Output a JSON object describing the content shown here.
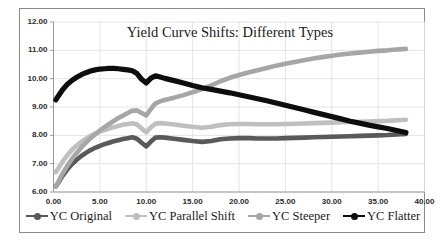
{
  "chart_data": {
    "type": "line",
    "title": "Yield Curve Shifts: Different Types",
    "xlabel": "",
    "ylabel": "",
    "xlim": [
      0,
      40
    ],
    "ylim": [
      6,
      12
    ],
    "xticks": [
      "0.00",
      "5.00",
      "10.00",
      "15.00",
      "20.00",
      "25.00",
      "30.00",
      "35.00",
      "40.00"
    ],
    "yticks": [
      "6.00",
      "7.00",
      "8.00",
      "9.00",
      "10.00",
      "11.00",
      "12.00"
    ],
    "grid": true,
    "legend_position": "bottom",
    "x": [
      0.25,
      0.5,
      1,
      1.5,
      2,
      2.5,
      3,
      3.5,
      4,
      4.5,
      5,
      5.5,
      6,
      6.5,
      7,
      7.5,
      8,
      8.5,
      9,
      9.5,
      10,
      10.5,
      11,
      11.5,
      12,
      13,
      14,
      15,
      16,
      17,
      18,
      19,
      20,
      21,
      22,
      23,
      24,
      25,
      26,
      27,
      28,
      29,
      30,
      31,
      32,
      33,
      34,
      35,
      36,
      37,
      38
    ],
    "series": [
      {
        "name": "YC Original",
        "color": "#595959",
        "values": [
          6.2,
          6.32,
          6.58,
          6.8,
          6.99,
          7.14,
          7.27,
          7.38,
          7.48,
          7.56,
          7.63,
          7.69,
          7.74,
          7.79,
          7.83,
          7.87,
          7.9,
          7.93,
          7.88,
          7.74,
          7.61,
          7.78,
          7.92,
          7.93,
          7.92,
          7.88,
          7.84,
          7.8,
          7.77,
          7.8,
          7.86,
          7.89,
          7.9,
          7.9,
          7.89,
          7.89,
          7.89,
          7.9,
          7.91,
          7.92,
          7.93,
          7.94,
          7.95,
          7.96,
          7.97,
          7.98,
          7.99,
          8.0,
          8.01,
          8.03,
          8.05
        ]
      },
      {
        "name": "YC Parallel Shift",
        "color": "#bfbfbf",
        "values": [
          6.7,
          6.82,
          7.08,
          7.3,
          7.49,
          7.64,
          7.77,
          7.88,
          7.98,
          8.06,
          8.13,
          8.19,
          8.24,
          8.29,
          8.33,
          8.37,
          8.4,
          8.43,
          8.38,
          8.24,
          8.11,
          8.28,
          8.42,
          8.43,
          8.42,
          8.38,
          8.34,
          8.3,
          8.27,
          8.3,
          8.36,
          8.39,
          8.4,
          8.4,
          8.39,
          8.39,
          8.39,
          8.4,
          8.41,
          8.42,
          8.43,
          8.44,
          8.45,
          8.46,
          8.47,
          8.48,
          8.49,
          8.5,
          8.51,
          8.53,
          8.55
        ]
      },
      {
        "name": "YC Steeper",
        "color": "#a6a6a6",
        "values": [
          6.2,
          6.35,
          6.66,
          6.93,
          7.17,
          7.38,
          7.57,
          7.74,
          7.9,
          8.04,
          8.17,
          8.29,
          8.4,
          8.51,
          8.61,
          8.7,
          8.79,
          8.87,
          8.88,
          8.79,
          8.7,
          8.93,
          9.13,
          9.2,
          9.25,
          9.33,
          9.42,
          9.52,
          9.63,
          9.76,
          9.91,
          10.03,
          10.13,
          10.22,
          10.3,
          10.38,
          10.46,
          10.53,
          10.59,
          10.65,
          10.71,
          10.76,
          10.81,
          10.85,
          10.89,
          10.92,
          10.95,
          10.98,
          11.0,
          11.03,
          11.05
        ]
      },
      {
        "name": "YC Flatter",
        "color": "#0d0d0d",
        "values": [
          9.25,
          9.38,
          9.62,
          9.8,
          9.94,
          10.05,
          10.14,
          10.21,
          10.27,
          10.31,
          10.34,
          10.35,
          10.36,
          10.36,
          10.35,
          10.33,
          10.31,
          10.28,
          10.18,
          9.98,
          9.85,
          10.02,
          10.1,
          10.06,
          10.01,
          9.93,
          9.85,
          9.76,
          9.68,
          9.62,
          9.56,
          9.5,
          9.43,
          9.36,
          9.29,
          9.22,
          9.14,
          9.06,
          8.98,
          8.9,
          8.82,
          8.74,
          8.66,
          8.58,
          8.5,
          8.43,
          8.36,
          8.3,
          8.24,
          8.17,
          8.1
        ]
      }
    ]
  },
  "legend": {
    "items": [
      {
        "label": "YC Original"
      },
      {
        "label": "YC Parallel Shift"
      },
      {
        "label": "YC Steeper"
      },
      {
        "label": "YC Flatter"
      }
    ]
  }
}
